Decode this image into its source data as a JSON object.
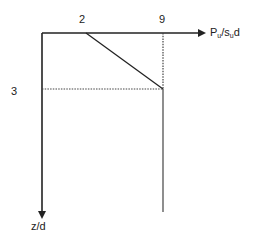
{
  "diagram": {
    "type": "line-diagram",
    "x_axis": {
      "label_main": "P",
      "label_sub": "u",
      "label_mid": "/s",
      "label_sub2": "u",
      "label_end": "d"
    },
    "y_axis": {
      "label": "z/d"
    },
    "ticks": {
      "x_start": "2",
      "x_end": "9",
      "y_depth": "3"
    },
    "curve": [
      {
        "z": 0,
        "P": 2
      },
      {
        "z": 3,
        "P": 9
      },
      {
        "z": "deeper",
        "P": 9
      }
    ],
    "colors": {
      "line": "#222222",
      "dotted": "#444444"
    }
  }
}
